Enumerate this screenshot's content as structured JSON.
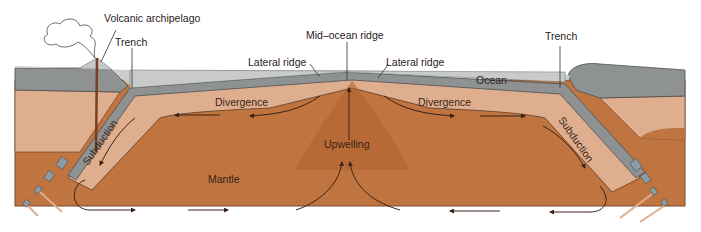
{
  "diagram": {
    "labels": {
      "volcanic_archipelago": "Volcanic archipelago",
      "trench_left": "Trench",
      "trench_right": "Trench",
      "mid_ocean_ridge": "Mid–ocean ridge",
      "lateral_ridge_left": "Lateral ridge",
      "lateral_ridge_right": "Lateral ridge",
      "ocean": "Ocean",
      "divergence_left": "Divergence",
      "divergence_right": "Divergence",
      "subduction_left": "Subduction",
      "subduction_right": "Subduction",
      "upwelling": "Upwelling",
      "mantle": "Mantle"
    },
    "colors": {
      "ocean_water": "#c9cbcb",
      "crust_gray": "#8f9293",
      "slab_blue_gray": "#8a9da6",
      "lithosphere_tan": "#dfae8e",
      "mantle_brown": "#c0743f",
      "ridge_dark": "#a85a2e",
      "arrow": "#3a2418",
      "background": "#ffffff"
    }
  }
}
